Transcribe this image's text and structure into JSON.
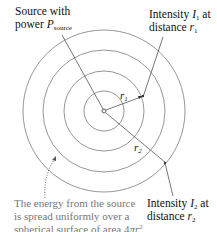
{
  "diagram": {
    "source_label": {
      "line1": "Source with",
      "line2_prefix": "power ",
      "symbol": "P",
      "subscript": "source"
    },
    "intensity1_label": {
      "line1_prefix": "Intensity ",
      "symbol": "I",
      "subscript": "1",
      "line1_suffix": " at",
      "line2_prefix": "distance ",
      "dist_symbol": "r",
      "dist_subscript": "1"
    },
    "intensity2_label": {
      "line1_prefix": "Intensity ",
      "symbol": "I",
      "subscript": "2",
      "line1_suffix": " at",
      "line2_prefix": "distance ",
      "dist_symbol": "r",
      "dist_subscript": "2"
    },
    "radius1_label": {
      "symbol": "r",
      "subscript": "1"
    },
    "radius2_label": {
      "symbol": "r",
      "subscript": "2"
    },
    "caption": {
      "line1": "The energy from the source",
      "line2": "is spread uniformly over a",
      "line3_prefix": "spherical surface of area 4",
      "pi": "π",
      "r": "r",
      "exp": "2",
      "end": "."
    },
    "circles": {
      "center": [
        104,
        111
      ],
      "radii": [
        20,
        40,
        61,
        81
      ]
    },
    "colors": {
      "circle": "#8a8a8a",
      "line": "#555555",
      "caption": "#777777"
    }
  }
}
